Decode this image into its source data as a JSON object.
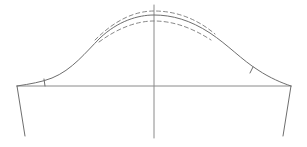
{
  "diagram": {
    "type": "sleeve-cap-pattern-draft",
    "width": 307,
    "height": 147,
    "colors": {
      "background": "#ffffff",
      "main_stroke": "#6e6e6e",
      "guide_stroke": "#8a8a8a",
      "dashed_stroke": "#7a7a7a"
    },
    "stroke_widths": {
      "main": 1,
      "guide": 1,
      "dashed": 0.9
    },
    "dash_pattern": "4 3",
    "elements": {
      "center_line": {
        "x1": 154,
        "y1": 5,
        "x2": 154,
        "y2": 138
      },
      "bicep_line": {
        "x1": 17,
        "y1": 86,
        "x2": 291,
        "y2": 86
      },
      "left_underarm_seam": {
        "x1": 17,
        "y1": 86,
        "x2": 25,
        "y2": 136
      },
      "right_underarm_seam": {
        "x1": 291,
        "y1": 86,
        "x2": 283,
        "y2": 136
      },
      "cap_curve_path": "M17,86 C30,84 42,82 52,78 C72,70 86,52 100,38 C118,21 138,15 154,15 C172,15 190,20 210,33 C228,45 242,60 258,70 C270,78 282,83 291,86",
      "upper_dashed_path": "M95,40 C115,20 135,11 154,11 C175,11 196,18 215,34",
      "lower_dashed_path": "M99,42 C118,28 137,21 154,21 C172,21 191,27 211,40",
      "left_notch": {
        "x1": 44,
        "y1": 79,
        "x2": 45,
        "y2": 86
      },
      "right_notch": {
        "x1": 253,
        "y1": 67,
        "x2": 250,
        "y2": 73
      }
    }
  }
}
